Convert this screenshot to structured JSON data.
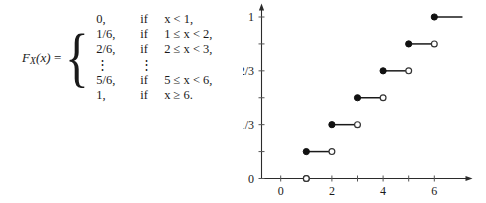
{
  "formula": {
    "function_label": "F",
    "function_subscript": "X",
    "function_arg": "(x)",
    "equals": "=",
    "open_brace": "{",
    "cases": [
      {
        "value": "0,",
        "if": "if",
        "condition": "x < 1,"
      },
      {
        "value": "1/6,",
        "if": "if",
        "condition": "1 ≤ x < 2,"
      },
      {
        "value": "2/6,",
        "if": "if",
        "condition": "2 ≤ x < 3,"
      },
      {
        "value": "⋮",
        "if": "⋮",
        "condition": ""
      },
      {
        "value": "5/6,",
        "if": "if",
        "condition": "5 ≤ x < 6,"
      },
      {
        "value": "1,",
        "if": "if",
        "condition": "x ≥ 6."
      }
    ]
  },
  "chart_data": {
    "type": "line",
    "subtype": "step-cdf",
    "title": "",
    "xlabel": "",
    "ylabel": "",
    "xlim": [
      -0.8,
      7.2
    ],
    "ylim": [
      0,
      1.08
    ],
    "grid": false,
    "legend": null,
    "x_ticks": [
      0,
      1,
      2,
      3,
      4,
      5,
      6
    ],
    "x_tick_labels": [
      "0",
      "",
      "2",
      "",
      "4",
      "",
      "6"
    ],
    "y_ticks": [
      0,
      0.16667,
      0.33333,
      0.5,
      0.66667,
      0.83333,
      1
    ],
    "y_tick_labels": [
      "0",
      "",
      "1/3",
      "",
      "2/3",
      "",
      "1"
    ],
    "steps": [
      {
        "x_start": 0,
        "x_end": 1,
        "y": 0,
        "closed_left": false,
        "open_right": true,
        "draw_segment": false
      },
      {
        "x_start": 1,
        "x_end": 2,
        "y": 0.16667,
        "closed_left": true,
        "open_right": true,
        "draw_segment": true
      },
      {
        "x_start": 2,
        "x_end": 3,
        "y": 0.33333,
        "closed_left": true,
        "open_right": true,
        "draw_segment": true
      },
      {
        "x_start": 3,
        "x_end": 4,
        "y": 0.5,
        "closed_left": true,
        "open_right": true,
        "draw_segment": true
      },
      {
        "x_start": 4,
        "x_end": 5,
        "y": 0.66667,
        "closed_left": true,
        "open_right": true,
        "draw_segment": true
      },
      {
        "x_start": 5,
        "x_end": 6,
        "y": 0.83333,
        "closed_left": true,
        "open_right": true,
        "draw_segment": true
      },
      {
        "x_start": 6,
        "x_end": 7.1,
        "y": 1,
        "closed_left": true,
        "open_right": false,
        "draw_segment": true
      }
    ],
    "origin_open_point": {
      "x": 1,
      "y": 0
    },
    "colors": {
      "axis": "#2b2b2b",
      "line": "#1a1a1a",
      "closed_dot": "#111111",
      "open_dot_fill": "#ffffff",
      "open_dot_stroke": "#333333",
      "background": "#ffffff"
    }
  }
}
